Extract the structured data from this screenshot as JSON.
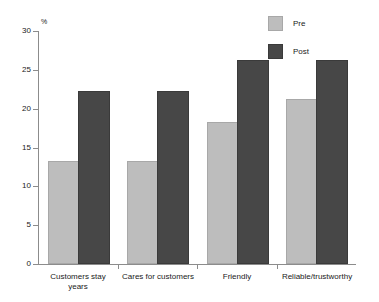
{
  "chart_data": {
    "type": "bar",
    "title": "",
    "xlabel": "",
    "ylabel": "%",
    "ylim": [
      0,
      30
    ],
    "yticks": [
      0,
      5,
      10,
      15,
      20,
      25,
      30
    ],
    "ytick_labels": [
      "0",
      "5",
      "10",
      "15",
      "20",
      "25",
      "30"
    ],
    "grid": false,
    "legend_position": "top-right",
    "categories": [
      "Customers stay years",
      "Cares for customers",
      "Friendly",
      "Reliable/trustworthy"
    ],
    "category_lines": [
      [
        "Customers stay",
        "years"
      ],
      [
        "Cares for customers"
      ],
      [
        "Friendly"
      ],
      [
        "Reliable/trustworthy"
      ]
    ],
    "series": [
      {
        "name": "Pre",
        "color": "#bdbdbd",
        "values": [
          13,
          13,
          18,
          21
        ]
      },
      {
        "name": "Post",
        "color": "#474747",
        "values": [
          22,
          22,
          26,
          26
        ]
      }
    ]
  },
  "legend": {
    "items": [
      {
        "label": "Pre",
        "color": "#bdbdbd"
      },
      {
        "label": "Post",
        "color": "#474747"
      }
    ]
  },
  "axis": {
    "y_unit": "%"
  },
  "colors": {
    "pre": "#bdbdbd",
    "post": "#474747",
    "axis": "#8c8c8c",
    "text": "#1a1a1a",
    "background": "#ffffff"
  }
}
